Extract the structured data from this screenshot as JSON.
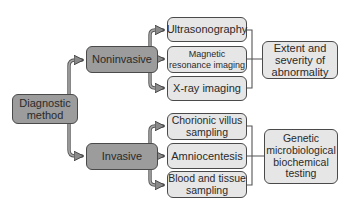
{
  "root": {
    "label": "Diagnostic\nmethod"
  },
  "categories": [
    {
      "label": "Noninvasive",
      "methods": [
        "Ultrasonography",
        "Magnetic\nresonance imaging",
        "X-ray imaging"
      ],
      "outcome": "Extent and\nseverity of\nabnormality"
    },
    {
      "label": "Invasive",
      "methods": [
        "Chorionic villus\nsampling",
        "Amniocentesis",
        "Blood and tissue\nsampling"
      ],
      "outcome": "Genetic\nmicrobiological\nbiochemical\ntesting"
    }
  ],
  "colors": {
    "category_fill": "#9c9c9c",
    "leaf_fill": "#e6e6e6",
    "border": "#4a4a4a",
    "arrow": "#8a8a8a"
  }
}
